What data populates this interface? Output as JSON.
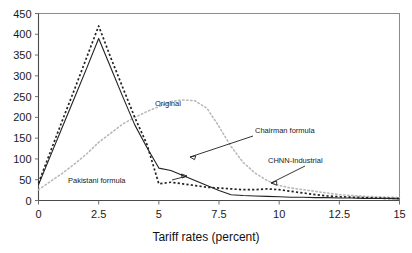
{
  "chart_data": {
    "type": "line",
    "title": "",
    "xlabel": "Tariff rates (percent)",
    "ylabel": "",
    "xlim": [
      0,
      15
    ],
    "ylim": [
      0,
      450
    ],
    "grid": false,
    "legend_position": "inline-annotations",
    "xticks": [
      "0",
      "2.5",
      "5",
      "7.5",
      "10",
      "12.5",
      "15"
    ],
    "xtick_values": [
      0,
      2.5,
      5,
      7.5,
      10,
      12.5,
      15
    ],
    "yticks": [
      "0",
      "50",
      "100",
      "150",
      "200",
      "250",
      "300",
      "350",
      "400",
      "450"
    ],
    "ytick_values": [
      0,
      50,
      100,
      150,
      200,
      250,
      300,
      350,
      400,
      450
    ],
    "series": [
      {
        "name": "Chairman formula",
        "style": "solid-black",
        "x": [
          0,
          0.5,
          1,
          1.5,
          2,
          2.5,
          3,
          3.5,
          4,
          4.5,
          5,
          5.5,
          6,
          6.5,
          7,
          7.5,
          8,
          8.5,
          9,
          9.5,
          10,
          10.5,
          11,
          11.5,
          12,
          12.5,
          13,
          13.5,
          14,
          14.5,
          15
        ],
        "values": [
          38,
          108,
          178,
          248,
          318,
          390,
          320,
          250,
          182,
          128,
          78,
          72,
          60,
          48,
          36,
          24,
          14,
          12,
          11,
          10,
          9,
          8,
          8,
          7,
          7,
          6,
          6,
          5,
          5,
          5,
          4
        ]
      },
      {
        "name": "Pakistani formula",
        "style": "dashed-black",
        "x": [
          0,
          0.5,
          1,
          1.5,
          2,
          2.5,
          3,
          3.5,
          4,
          4.5,
          5,
          5.5,
          6,
          6.5,
          7,
          7.5,
          8,
          8.5,
          9,
          9.5,
          10,
          10.5,
          11,
          11.5,
          12,
          12.5,
          13,
          13.5,
          14,
          14.5,
          15
        ],
        "values": [
          42,
          118,
          194,
          268,
          344,
          420,
          344,
          272,
          200,
          136,
          40,
          44,
          40,
          36,
          32,
          30,
          28,
          26,
          26,
          28,
          26,
          22,
          18,
          14,
          11,
          9,
          8,
          7,
          6,
          5,
          5
        ]
      },
      {
        "name": "Original",
        "style": "dotted-gray",
        "x": [
          0,
          0.5,
          1,
          1.5,
          2,
          2.5,
          3,
          3.5,
          4,
          4.5,
          5,
          5.5,
          6,
          6.5,
          7,
          7.5,
          8,
          8.5,
          9,
          9.5,
          10,
          10.5,
          11,
          11.5,
          12,
          12.5,
          13,
          13.5,
          14,
          14.5,
          15
        ],
        "values": [
          26,
          46,
          66,
          88,
          112,
          140,
          162,
          184,
          200,
          214,
          226,
          238,
          242,
          240,
          222,
          178,
          130,
          92,
          66,
          48,
          36,
          30,
          26,
          22,
          18,
          14,
          12,
          10,
          9,
          8,
          7
        ]
      }
    ],
    "annotations": [
      {
        "text": "Original",
        "target_series": "Original"
      },
      {
        "text": "Chairman formula",
        "target_series": "Chairman formula"
      },
      {
        "text": "CHNN-Industrial",
        "target_series": "Pakistani formula"
      },
      {
        "text": "Pakistani formula",
        "target_series": "Pakistani formula"
      }
    ]
  },
  "colors": {
    "solid_series": "#222222",
    "dashed_series": "#222222",
    "dotted_series": "#b9b9b9",
    "axis": "#4a4a4a",
    "frame": "#8c8c8c",
    "text": "#1a1a1a",
    "background": "#ffffff"
  }
}
